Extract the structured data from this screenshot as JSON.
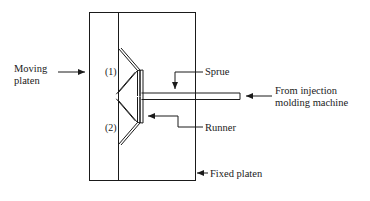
{
  "figure": {
    "stroke_color": "#1a1a1a",
    "background_color": "#ffffff"
  },
  "labels": {
    "moving_platen": "Moving\nplaten",
    "cavity_1": "(1)",
    "cavity_2": "(2)",
    "sprue": "Sprue",
    "runner": "Runner",
    "from_machine": "From injection\nmolding machine",
    "fixed_platen": "Fixed platen"
  },
  "parts": {
    "mold_block": "mold-block-outline",
    "parting_line": "vertical-parting-line",
    "cavity_upper": "upper-chevron-cavity",
    "cavity_lower": "lower-chevron-cavity",
    "runner_channel": "vertical-runner-channel",
    "sprue_channel": "horizontal-sprue-channel"
  },
  "leaders": {
    "moving_platen_arrow": "arrow-right",
    "sprue_arrow": "arrow-down",
    "runner_arrow": "arrow-left",
    "from_machine_arrow": "arrow-left",
    "fixed_platen_arrow": "arrow-left"
  }
}
